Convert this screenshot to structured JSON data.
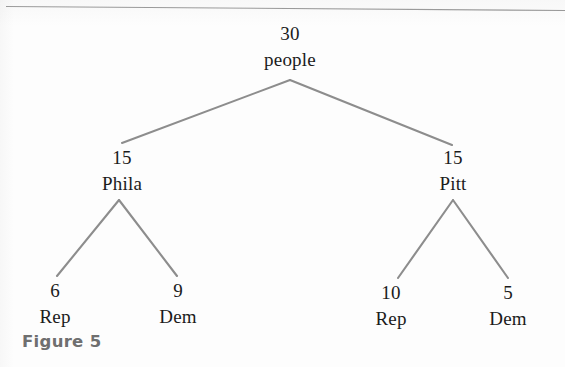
{
  "figure": {
    "caption": "Figure 5",
    "top_rule_color": "#9a9a9a",
    "edge_color": "#8d8d8d",
    "text_color": "#1b1b1b",
    "background_color": "#fdfdfd"
  },
  "chart_data": {
    "type": "diagram",
    "subtype": "tree",
    "title": "Figure 5",
    "orientation": "top-down",
    "levels": 3,
    "root": {
      "id": "root",
      "count": "30",
      "label": "people"
    },
    "nodes": [
      {
        "id": "root",
        "count": "30",
        "label": "people",
        "level": 0,
        "parent": null,
        "x": 290,
        "y": 24
      },
      {
        "id": "phila",
        "count": "15",
        "label": "Phila",
        "level": 1,
        "parent": "root",
        "x": 122,
        "y": 148
      },
      {
        "id": "pitt",
        "count": "15",
        "label": "Pitt",
        "level": 1,
        "parent": "root",
        "x": 453,
        "y": 148
      },
      {
        "id": "phila-rep",
        "count": "6",
        "label": "Rep",
        "level": 2,
        "parent": "phila",
        "x": 55,
        "y": 281
      },
      {
        "id": "phila-dem",
        "count": "9",
        "label": "Dem",
        "level": 2,
        "parent": "phila",
        "x": 178,
        "y": 281
      },
      {
        "id": "pitt-rep",
        "count": "10",
        "label": "Rep",
        "level": 2,
        "parent": "pitt",
        "x": 391,
        "y": 283
      },
      {
        "id": "pitt-dem",
        "count": "5",
        "label": "Dem",
        "level": 2,
        "parent": "pitt",
        "x": 508,
        "y": 283
      }
    ],
    "edges": [
      {
        "from": "root",
        "to": "phila",
        "x1": 290,
        "y1": 80,
        "x2": 122,
        "y2": 143
      },
      {
        "from": "root",
        "to": "pitt",
        "x1": 290,
        "y1": 80,
        "x2": 452,
        "y2": 145
      },
      {
        "from": "phila",
        "to": "phila-rep",
        "x1": 119,
        "y1": 200,
        "x2": 57,
        "y2": 276
      },
      {
        "from": "phila",
        "to": "phila-dem",
        "x1": 119,
        "y1": 200,
        "x2": 177,
        "y2": 276
      },
      {
        "from": "pitt",
        "to": "pitt-rep",
        "x1": 453,
        "y1": 200,
        "x2": 398,
        "y2": 278
      },
      {
        "from": "pitt",
        "to": "pitt-dem",
        "x1": 453,
        "y1": 200,
        "x2": 508,
        "y2": 278
      }
    ]
  }
}
